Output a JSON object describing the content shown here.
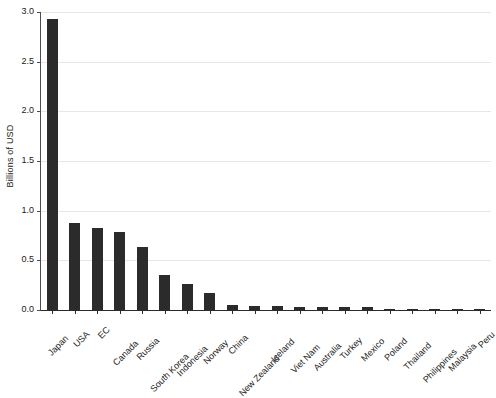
{
  "chart_data": {
    "type": "bar",
    "title": "",
    "xlabel": "",
    "ylabel": "Billions of USD",
    "ylim": [
      0.0,
      3.0
    ],
    "yticks": [
      "0.0",
      "0.5",
      "1.0",
      "1.5",
      "2.0",
      "2.5",
      "3.0"
    ],
    "ytick_values": [
      0.0,
      0.5,
      1.0,
      1.5,
      2.0,
      2.5,
      3.0
    ],
    "grid": "horizontal",
    "legend": "none",
    "bar_color": "#2b2b2b",
    "gridline_color": "#e6e6e6",
    "axis_color": "#2b2b2b",
    "background_color": "#ffffff",
    "categories": [
      "Japan",
      "USA",
      "EC",
      "Canada",
      "Russia",
      "South Korea",
      "Indonesia",
      "Norway",
      "China",
      "New Zealand",
      "Iceland",
      "Viet Nam",
      "Australia",
      "Turkey",
      "Mexico",
      "Poland",
      "Thailand",
      "Philippines",
      "Malaysia",
      "Peru"
    ],
    "values": [
      2.93,
      0.875,
      0.83,
      0.785,
      0.635,
      0.35,
      0.26,
      0.17,
      0.055,
      0.04,
      0.04,
      0.035,
      0.035,
      0.03,
      0.035,
      0.012,
      0.01,
      0.008,
      0.007,
      0.006
    ]
  }
}
